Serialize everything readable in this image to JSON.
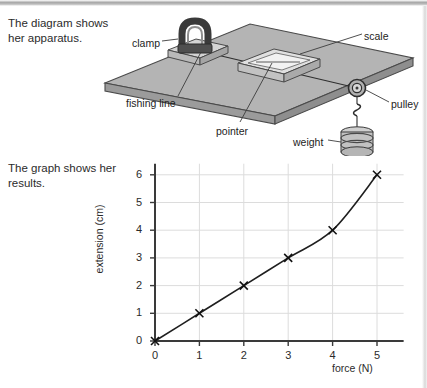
{
  "captions": {
    "diagram": "The diagram shows her apparatus.",
    "graph": "The graph shows her results."
  },
  "diagram": {
    "labels": {
      "clamp": "clamp",
      "scale": "scale",
      "fishing_line": "fishing line",
      "pointer": "pointer",
      "pulley": "pulley",
      "weight": "weight"
    },
    "colors": {
      "bench_top": "#b3b3b3",
      "bench_side": "#9a9a9a",
      "bench_edge": "#4a4a4a",
      "clamp_dark": "#3b3b3b",
      "block_light": "#d7d7d7",
      "leader_line": "#3c3c3c"
    }
  },
  "chart_data": {
    "type": "line",
    "title": "",
    "xlabel": "force (N)",
    "ylabel": "extension (cm)",
    "xlim": [
      0,
      5.6
    ],
    "ylim": [
      0,
      6.4
    ],
    "xticks": [
      "0",
      "1",
      "2",
      "3",
      "4",
      "5"
    ],
    "yticks": [
      "0",
      "1",
      "2",
      "3",
      "4",
      "5",
      "6"
    ],
    "grid": true,
    "grid_axis": "y",
    "legend": "none",
    "marker": "x-cross",
    "series": [
      {
        "name": "extension vs force",
        "x": [
          0,
          1,
          2,
          3,
          4,
          5
        ],
        "values": [
          0,
          1,
          2,
          3,
          4,
          6
        ]
      }
    ],
    "colors": {
      "line": "#1f1f1f",
      "axis": "#3a3a3a",
      "grid": "#dcdcdc",
      "marker": "#111111"
    }
  }
}
